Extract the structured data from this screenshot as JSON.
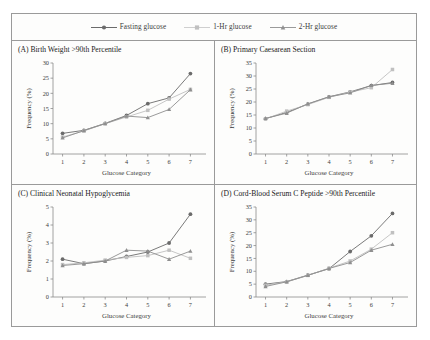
{
  "legend": {
    "items": [
      {
        "label": "Fasting glucose",
        "marker": "circle",
        "color": "#6b6b6b"
      },
      {
        "label": "1-Hr glucose",
        "marker": "square",
        "color": "#c0c0c0"
      },
      {
        "label": "2-Hr glucose",
        "marker": "triangle",
        "color": "#8f8f8f"
      }
    ]
  },
  "axis_titles": {
    "x": "Glucose Category",
    "y": "Frequency (%)"
  },
  "chart_data": [
    {
      "type": "line",
      "panel": "A",
      "title": "(A) Birth Weight >90th Percentile",
      "categories": [
        "1",
        "2",
        "3",
        "4",
        "5",
        "6",
        "7"
      ],
      "x": [
        1,
        2,
        3,
        4,
        5,
        6,
        7
      ],
      "xlabel": "Glucose Category",
      "ylabel": "Frequency (%)",
      "ylim": [
        0,
        30
      ],
      "yticks": [
        0,
        5,
        10,
        15,
        20,
        25,
        30
      ],
      "xticks": [
        1,
        2,
        3,
        4,
        5,
        6,
        7
      ],
      "grid": false,
      "legend_position": "top",
      "series": [
        {
          "name": "Fasting glucose",
          "marker": "circle",
          "color": "#6b6b6b",
          "values": [
            6.8,
            7.8,
            10.1,
            12.7,
            16.6,
            18.5,
            26.5
          ]
        },
        {
          "name": "1-Hr glucose",
          "marker": "square",
          "color": "#c0c0c0",
          "values": [
            5.6,
            7.6,
            10.0,
            12.2,
            14.4,
            18.1,
            21.3
          ]
        },
        {
          "name": "2-Hr glucose",
          "marker": "triangle",
          "color": "#8f8f8f",
          "values": [
            5.3,
            7.7,
            10.0,
            12.5,
            12.0,
            14.7,
            21.2
          ]
        }
      ]
    },
    {
      "type": "line",
      "panel": "B",
      "title": "(B) Primary Caesarean Section",
      "categories": [
        "1",
        "2",
        "3",
        "4",
        "5",
        "6",
        "7"
      ],
      "x": [
        1,
        2,
        3,
        4,
        5,
        6,
        7
      ],
      "xlabel": "Glucose Category",
      "ylabel": "Frequency (%)",
      "ylim": [
        0,
        35
      ],
      "yticks": [
        0,
        5,
        10,
        15,
        20,
        25,
        30,
        35
      ],
      "xticks": [
        1,
        2,
        3,
        4,
        5,
        6,
        7
      ],
      "grid": false,
      "legend_position": "top",
      "series": [
        {
          "name": "Fasting glucose",
          "marker": "circle",
          "color": "#6b6b6b",
          "values": [
            13.6,
            16.0,
            19.2,
            22.0,
            23.9,
            26.3,
            27.5
          ]
        },
        {
          "name": "1-Hr glucose",
          "marker": "square",
          "color": "#c0c0c0",
          "values": [
            13.5,
            16.5,
            19.0,
            21.8,
            23.8,
            25.5,
            32.5
          ]
        },
        {
          "name": "2-Hr glucose",
          "marker": "triangle",
          "color": "#8f8f8f",
          "values": [
            13.7,
            15.7,
            19.3,
            22.0,
            23.5,
            26.4,
            27.2
          ]
        }
      ]
    },
    {
      "type": "line",
      "panel": "C",
      "title": "(C) Clinical Neonatal Hypoglycemia",
      "categories": [
        "1",
        "2",
        "3",
        "4",
        "5",
        "6",
        "7"
      ],
      "x": [
        1,
        2,
        3,
        4,
        5,
        6,
        7
      ],
      "xlabel": "Glucose Category",
      "ylabel": "Frequency (%)",
      "ylim": [
        0,
        5
      ],
      "yticks": [
        0,
        1,
        2,
        3,
        4,
        5
      ],
      "xticks": [
        1,
        2,
        3,
        4,
        5,
        6,
        7
      ],
      "grid": false,
      "legend_position": "top",
      "series": [
        {
          "name": "Fasting glucose",
          "marker": "circle",
          "color": "#6b6b6b",
          "values": [
            2.1,
            1.85,
            2.0,
            2.25,
            2.5,
            3.0,
            4.6
          ]
        },
        {
          "name": "1-Hr glucose",
          "marker": "square",
          "color": "#c0c0c0",
          "values": [
            1.8,
            1.9,
            2.05,
            2.2,
            2.3,
            2.6,
            2.15
          ]
        },
        {
          "name": "2-Hr glucose",
          "marker": "triangle",
          "color": "#8f8f8f",
          "values": [
            1.75,
            1.85,
            2.0,
            2.6,
            2.55,
            2.1,
            2.55
          ]
        }
      ]
    },
    {
      "type": "line",
      "panel": "D",
      "title": "(D) Cord-Blood Serum C Peptide >90th Percentile",
      "categories": [
        "1",
        "2",
        "3",
        "4",
        "5",
        "6",
        "7"
      ],
      "x": [
        1,
        2,
        3,
        4,
        5,
        6,
        7
      ],
      "xlabel": "Glucose Category",
      "ylabel": "Frequency (%)",
      "ylim": [
        0,
        35
      ],
      "yticks": [
        0,
        5,
        10,
        15,
        20,
        25,
        30,
        35
      ],
      "xticks": [
        1,
        2,
        3,
        4,
        5,
        6,
        7
      ],
      "grid": false,
      "legend_position": "top",
      "series": [
        {
          "name": "Fasting glucose",
          "marker": "circle",
          "color": "#6b6b6b",
          "values": [
            5.0,
            6.0,
            8.5,
            11.0,
            17.7,
            23.8,
            32.5
          ]
        },
        {
          "name": "1-Hr glucose",
          "marker": "square",
          "color": "#c0c0c0",
          "values": [
            4.6,
            5.9,
            8.4,
            11.2,
            14.0,
            18.6,
            25.0
          ]
        },
        {
          "name": "2-Hr glucose",
          "marker": "triangle",
          "color": "#8f8f8f",
          "values": [
            4.1,
            5.9,
            8.4,
            11.1,
            13.4,
            18.2,
            20.5
          ]
        }
      ]
    }
  ]
}
